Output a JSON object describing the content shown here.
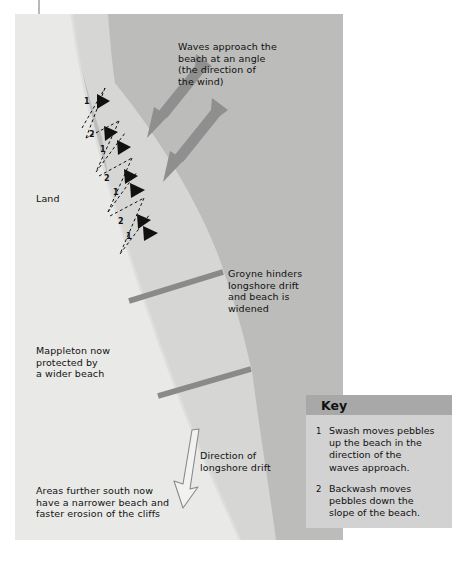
{
  "figure": {
    "regions": {
      "land_label": "Land",
      "land_color": "#e9e9e7",
      "beach_color": "#d6d6d4",
      "sea_color": "#bcbcba",
      "groyne_color": "#8a8a8a",
      "wave_arrow_color": "#8f8f8f",
      "drift_arrow_fill": "#f2f2f0",
      "drift_arrow_stroke": "#8a8a8a",
      "zigzag_color": "#111111",
      "text_color": "#111111"
    },
    "annotations": [
      {
        "name": "waves-approach-note",
        "text": "Waves approach the\nbeach at an angle\n(the direction of\nthe wind)",
        "x": 178,
        "y": 41
      },
      {
        "name": "groyne-note",
        "text": "Groyne hinders\nlongshore drift\nand beach is\nwidened",
        "x": 228,
        "y": 268
      },
      {
        "name": "mappleton-note",
        "text": "Mappleton now\nprotected by\na wider beach",
        "x": 36,
        "y": 345
      },
      {
        "name": "drift-direction-note",
        "text": "Direction of\nlongshore drift",
        "x": 200,
        "y": 450
      },
      {
        "name": "southern-erosion-note",
        "text": "Areas further south now\nhave a narrower beach and\nfaster erosion of the cliffs",
        "x": 36,
        "y": 485
      }
    ],
    "land_label_pos": {
      "x": 36,
      "y": 193
    },
    "zigzag_markers": [
      {
        "label": "1",
        "x": 88,
        "y": 102
      },
      {
        "label": "2",
        "x": 92,
        "y": 135
      },
      {
        "label": "1",
        "x": 99,
        "y": 147
      },
      {
        "label": "2",
        "x": 104,
        "y": 180
      },
      {
        "label": "1",
        "x": 111,
        "y": 190
      },
      {
        "label": "2",
        "x": 117,
        "y": 219
      },
      {
        "label": "1",
        "x": 124,
        "y": 233
      }
    ]
  },
  "key": {
    "title": "Key",
    "entries": [
      {
        "num": "1",
        "text": "Swash moves pebbles\nup the beach in the\ndirection of the\nwaves approach."
      },
      {
        "num": "2",
        "text": "Backwash moves\npebbles down the\nslope of the beach."
      }
    ]
  }
}
